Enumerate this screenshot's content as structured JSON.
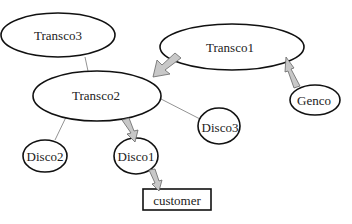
{
  "diagram": {
    "type": "network",
    "nodes": [
      {
        "id": "transco3",
        "label": "Transco3",
        "shape": "ellipse",
        "cx": 58,
        "cy": 35,
        "rx": 57,
        "ry": 22
      },
      {
        "id": "transco1",
        "label": "Transco1",
        "shape": "ellipse",
        "cx": 232,
        "cy": 47,
        "rx": 72,
        "ry": 23
      },
      {
        "id": "transco2",
        "label": "Transco2",
        "shape": "ellipse",
        "cx": 97,
        "cy": 96,
        "rx": 64,
        "ry": 25
      },
      {
        "id": "genco",
        "label": "Genco",
        "shape": "ellipse",
        "cx": 315,
        "cy": 100,
        "rx": 25,
        "ry": 15
      },
      {
        "id": "disco3",
        "label": "Disco3",
        "shape": "ellipse",
        "cx": 218,
        "cy": 125,
        "rx": 20,
        "ry": 18
      },
      {
        "id": "disco2",
        "label": "Disco2",
        "shape": "ellipse",
        "cx": 45,
        "cy": 155,
        "rx": 22,
        "ry": 16
      },
      {
        "id": "disco1",
        "label": "Disco1",
        "shape": "ellipse",
        "cx": 136,
        "cy": 156,
        "rx": 22,
        "ry": 18
      },
      {
        "id": "customer",
        "label": "customer",
        "shape": "rect",
        "x": 143,
        "y": 189,
        "w": 68,
        "h": 21
      }
    ],
    "edges": [
      {
        "from": "transco3",
        "to": "transco2",
        "style": "line"
      },
      {
        "from": "transco2",
        "to": "disco2",
        "style": "line"
      },
      {
        "from": "transco2",
        "to": "disco3",
        "style": "line"
      },
      {
        "from": "transco1",
        "to": "transco2",
        "style": "flow-arrow"
      },
      {
        "from": "genco",
        "to": "transco1",
        "style": "flow-arrow"
      },
      {
        "from": "transco2",
        "to": "disco1",
        "style": "flow-arrow"
      },
      {
        "from": "disco1",
        "to": "customer",
        "style": "flow-arrow"
      }
    ]
  }
}
